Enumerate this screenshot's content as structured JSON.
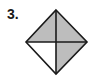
{
  "problem": {
    "number_label": "3."
  },
  "figure": {
    "shape": "diamond",
    "regions": [
      {
        "name": "top-left",
        "shaded": true
      },
      {
        "name": "top-right",
        "shaded": true
      },
      {
        "name": "bottom-left",
        "shaded": false
      },
      {
        "name": "bottom-right",
        "shaded": true
      }
    ],
    "shaded_fraction": "3/4",
    "colors": {
      "shade": "#bdbdbd",
      "stroke": "#1a1a1a",
      "unshaded": "#ffffff"
    }
  }
}
